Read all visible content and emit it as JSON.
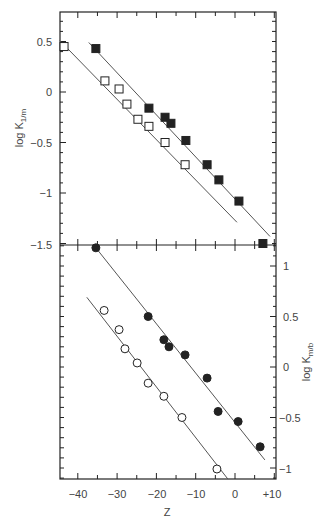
{
  "chart_data": [
    {
      "type": "scatter",
      "panel": "top",
      "title": "",
      "xlabel": "Z",
      "ylabel": "log K1/m",
      "ylabel_main": "log K",
      "ylabel_sub": "1/m",
      "xlim": [
        -45,
        10.5
      ],
      "ylim": [
        -1.5,
        0.8
      ],
      "yaxis_side": "left",
      "y_tick_labels": [
        "0.5",
        "0",
        "−0.5",
        "−1",
        "−1.5"
      ],
      "y_ticks": [
        0.5,
        0,
        -0.5,
        -1,
        -1.5
      ],
      "grid": false,
      "legend": "none",
      "series": [
        {
          "name": "open squares",
          "marker": "open-square",
          "x": [
            -43.5,
            -33.1,
            -29.5,
            -27.5,
            -24.7,
            -21.9,
            -17.8,
            -12.7
          ],
          "y": [
            0.45,
            0.11,
            0.03,
            -0.12,
            -0.27,
            -0.34,
            -0.5,
            -0.72
          ],
          "fit_line": {
            "x": [
              -44.6,
              0.5
            ],
            "y": [
              0.51,
              -1.29
            ]
          }
        },
        {
          "name": "filled squares",
          "marker": "filled-square",
          "x": [
            -35.4,
            -21.9,
            -17.8,
            -16.3,
            -12.5,
            -7.1,
            -4.1,
            1.0,
            7.1
          ],
          "y": [
            0.43,
            -0.16,
            -0.25,
            -0.31,
            -0.48,
            -0.72,
            -0.87,
            -1.08,
            -1.5
          ],
          "fit_line": {
            "x": [
              -37.2,
              8.9
            ],
            "y": [
              0.49,
              -1.43
            ]
          }
        }
      ]
    },
    {
      "type": "scatter",
      "panel": "bottom",
      "title": "",
      "xlabel": "Z",
      "ylabel": "log Km/b",
      "ylabel_main": "log K",
      "ylabel_sub": "m/b",
      "xlim": [
        -45,
        10.5
      ],
      "ylim": [
        -1.1,
        1.2
      ],
      "yaxis_side": "right",
      "y_tick_labels": [
        "1",
        "0.5",
        "0",
        "−0.5",
        "−1"
      ],
      "y_ticks": [
        1,
        0.5,
        0,
        -0.5,
        -1
      ],
      "grid": false,
      "legend": "none",
      "series": [
        {
          "name": "filled circles",
          "marker": "filled-circle",
          "x": [
            -35.4,
            -22.1,
            -18.1,
            -16.8,
            -12.7,
            -7.1,
            -4.3,
            0.8,
            6.4
          ],
          "y": [
            1.18,
            0.5,
            0.27,
            0.2,
            0.12,
            -0.11,
            -0.44,
            -0.54,
            -0.79
          ],
          "fit_line": {
            "x": [
              -35.4,
              7.6
            ],
            "y": [
              1.18,
              -0.92
            ]
          }
        },
        {
          "name": "open circles",
          "marker": "open-circle",
          "x": [
            -33.3,
            -29.5,
            -28.0,
            -24.9,
            -22.1,
            -18.1,
            -13.5,
            -4.6
          ],
          "y": [
            0.56,
            0.37,
            0.18,
            0.04,
            -0.16,
            -0.29,
            -0.5,
            -1.01
          ],
          "fit_line": {
            "x": [
              -37.7,
              -1.8
            ],
            "y": [
              0.69,
              -1.11
            ]
          }
        }
      ]
    }
  ],
  "x_axis": {
    "label": "Z",
    "tick_labels": [
      "−40",
      "−30",
      "−20",
      "−10",
      "0",
      "+10"
    ],
    "ticks": [
      -40,
      -30,
      -20,
      -10,
      0,
      10
    ]
  },
  "top_panel": {
    "ylabel_main": "log K",
    "ylabel_sub": "1/m",
    "tick_labels": [
      "0.5",
      "0",
      "−0.5",
      "−1",
      "−1.5"
    ]
  },
  "bottom_panel": {
    "ylabel_main": "log K",
    "ylabel_sub": "m/b",
    "tick_labels": [
      "1",
      "0.5",
      "0",
      "−0.5",
      "−1"
    ]
  },
  "colors": {
    "ink": "#222222",
    "line": "#555555",
    "background": "#ffffff"
  }
}
